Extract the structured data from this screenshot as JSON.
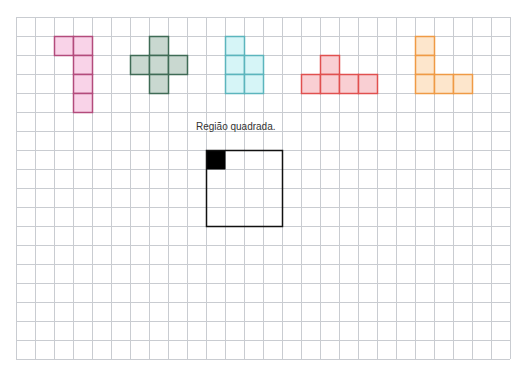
{
  "grid": {
    "origin_x": 16,
    "origin_y": 17,
    "cell_size": 19,
    "cols": 26,
    "rows": 18,
    "line_color": "#c9ccd1"
  },
  "label": {
    "text": "Região quadrada.",
    "x": 196,
    "y": 121
  },
  "shapes": [
    {
      "name": "pink-shape",
      "fill": "#f9d3e8",
      "stroke": "#b34b7c",
      "cells": [
        [
          2,
          1
        ],
        [
          3,
          1
        ],
        [
          3,
          2
        ],
        [
          3,
          3
        ],
        [
          3,
          4
        ]
      ]
    },
    {
      "name": "green-cross-shape",
      "fill": "#c9d8d0",
      "stroke": "#3f6b56",
      "cells": [
        [
          7,
          1
        ],
        [
          6,
          2
        ],
        [
          7,
          2
        ],
        [
          8,
          2
        ],
        [
          7,
          3
        ]
      ]
    },
    {
      "name": "cyan-shape",
      "fill": "#d6f5f7",
      "stroke": "#5bb5bd",
      "cells": [
        [
          11,
          1
        ],
        [
          11,
          2
        ],
        [
          12,
          2
        ],
        [
          11,
          3
        ],
        [
          12,
          3
        ]
      ]
    },
    {
      "name": "red-shape",
      "fill": "#f9cfd3",
      "stroke": "#e0504f",
      "cells": [
        [
          16,
          2
        ],
        [
          15,
          3
        ],
        [
          16,
          3
        ],
        [
          17,
          3
        ],
        [
          18,
          3
        ]
      ]
    },
    {
      "name": "orange-l-shape",
      "fill": "#fde6cc",
      "stroke": "#ef9a45",
      "cells": [
        [
          21,
          1
        ],
        [
          21,
          2
        ],
        [
          21,
          3
        ],
        [
          22,
          3
        ],
        [
          23,
          3
        ]
      ]
    }
  ],
  "square_region": {
    "col": 10,
    "row": 7,
    "size": 4,
    "stroke": "#111111",
    "filled_cell": [
      10,
      7
    ],
    "filled_color": "#000000"
  }
}
